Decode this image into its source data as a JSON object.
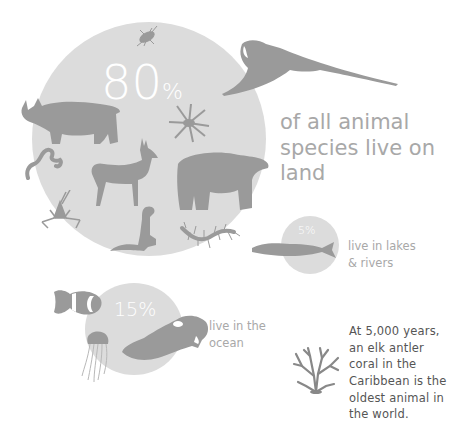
{
  "colors": {
    "background": "#ffffff",
    "circle": "#dcdcdc",
    "silhouette": "#9a9a9a",
    "percent_text": "#ffffff",
    "caption_text": "#a8a8a8",
    "fact_text": "#555555"
  },
  "land": {
    "percent_value": "80",
    "percent_sign": "%",
    "caption_lines": [
      "of all animal",
      "species live on",
      "land"
    ],
    "animals": [
      "beetle-icon",
      "parrot-icon",
      "rhino-icon",
      "spider-icon",
      "worm-icon",
      "deer-icon",
      "bear-icon",
      "grasshopper-icon",
      "ferret-icon",
      "centipede-icon"
    ]
  },
  "freshwater": {
    "percent": "5%",
    "caption_lines": [
      "live in lakes",
      "& rivers"
    ],
    "animals": [
      "trout-icon"
    ]
  },
  "ocean": {
    "percent": "15%",
    "caption_lines": [
      "live in the",
      "ocean"
    ],
    "animals": [
      "clownfish-icon",
      "jellyfish-icon",
      "cuttlefish-icon"
    ]
  },
  "fact": {
    "lines": [
      "At 5,000 years,",
      "an elk antler",
      "coral in the",
      "Caribbean is the",
      "oldest animal in",
      "the world."
    ],
    "icon": "elk-antler-coral-icon"
  }
}
